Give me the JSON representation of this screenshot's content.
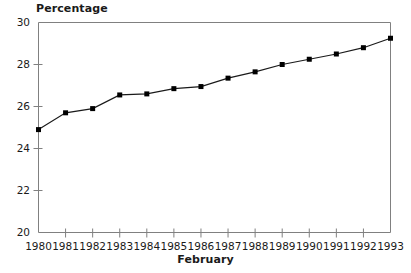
{
  "chart_data": {
    "type": "line",
    "title": "",
    "ylabel": "Percentage",
    "xlabel": "February",
    "x": [
      1980,
      1981,
      1982,
      1983,
      1984,
      1985,
      1986,
      1987,
      1988,
      1989,
      1990,
      1991,
      1992,
      1993
    ],
    "categories": [
      "1980",
      "1981",
      "1982",
      "1983",
      "1984",
      "1985",
      "1986",
      "1987",
      "1988",
      "1989",
      "1990",
      "1991",
      "1992",
      "1993"
    ],
    "values": [
      24.9,
      25.7,
      25.9,
      26.55,
      26.6,
      26.85,
      26.95,
      27.35,
      27.65,
      28.0,
      28.25,
      28.5,
      28.8,
      29.25
    ],
    "ylim": [
      20,
      30
    ],
    "xlim": [
      1980,
      1993
    ],
    "yticks": [
      20,
      22,
      24,
      26,
      28,
      30
    ],
    "ytick_labels": [
      "20",
      "22",
      "24",
      "26",
      "28",
      "30"
    ],
    "xtick_labels": [
      "1980",
      "1981",
      "1982",
      "1983",
      "1984",
      "1985",
      "1986",
      "1987",
      "1988",
      "1989",
      "1990",
      "1991",
      "1992",
      "1993"
    ],
    "grid": false,
    "legend": null,
    "marker": "square",
    "line_color": "#1a1a1a",
    "marker_color": "#000000",
    "axis_color": "#808080"
  }
}
